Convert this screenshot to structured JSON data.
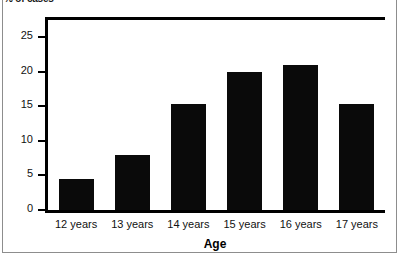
{
  "chart_data": {
    "type": "bar",
    "title": "",
    "xlabel": "Age",
    "ylabel": "% of cases",
    "categories": [
      "12 years",
      "13 years",
      "14 years",
      "15 years",
      "16 years",
      "17 years"
    ],
    "values": [
      4.5,
      8,
      15.3,
      20,
      21,
      15.3
    ],
    "yticks": [
      0,
      5,
      10,
      15,
      20,
      25
    ],
    "ytick_labels": [
      "0",
      "5",
      "10",
      "15",
      "20",
      "25"
    ],
    "ylim": [
      0,
      27.5
    ],
    "grid": false,
    "legend": null,
    "bar_color": "#0a0a0a",
    "series": [
      {
        "name": "% of cases",
        "values": [
          4.5,
          8,
          15.3,
          20,
          21,
          15.3
        ]
      }
    ]
  },
  "figure": {
    "background_color": "#ffffff",
    "frame_color": "#8d8d8d",
    "axis_color": "#000000"
  }
}
